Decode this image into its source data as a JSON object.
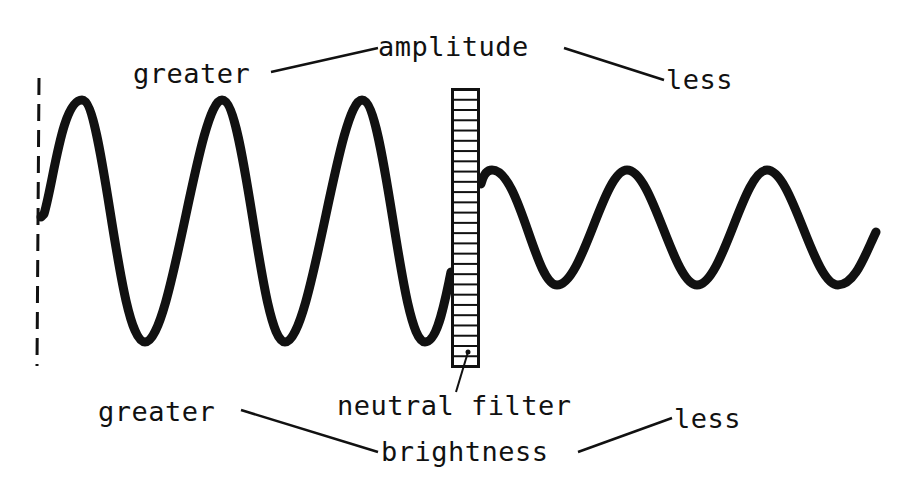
{
  "diagram": {
    "labels": {
      "amplitude": "amplitude",
      "amplitude_greater": "greater",
      "amplitude_less": "less",
      "filter": "neutral filter",
      "brightness": "brightness",
      "brightness_greater": "greater",
      "brightness_less": "less"
    },
    "colors": {
      "ink": "#111111",
      "background": "#ffffff"
    },
    "wave_before_filter": {
      "amplitude": "greater",
      "peaks": 3,
      "troughs": 3
    },
    "wave_after_filter": {
      "amplitude": "less",
      "peaks": 3,
      "troughs": 3
    }
  }
}
